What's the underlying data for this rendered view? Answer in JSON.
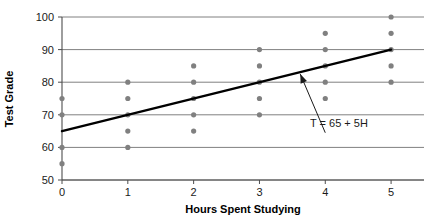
{
  "chart_data": {
    "type": "scatter",
    "title": "",
    "xlabel": "Hours Spent Studying",
    "ylabel": "Test Grade",
    "xlim": [
      0,
      5.5
    ],
    "ylim": [
      50,
      100
    ],
    "xticks": [
      "0",
      "1",
      "2",
      "3",
      "4",
      "5"
    ],
    "xtick_values": [
      0,
      1,
      2,
      3,
      4,
      5
    ],
    "yticks": [
      "50",
      "60",
      "70",
      "80",
      "90",
      "100"
    ],
    "ytick_values": [
      50,
      60,
      70,
      80,
      90,
      100
    ],
    "grid": "horizontal",
    "legend": "none",
    "points": [
      {
        "x": 0,
        "y": 75
      },
      {
        "x": 0,
        "y": 70
      },
      {
        "x": 0,
        "y": 60
      },
      {
        "x": 0,
        "y": 55
      },
      {
        "x": 1,
        "y": 80
      },
      {
        "x": 1,
        "y": 75
      },
      {
        "x": 1,
        "y": 70
      },
      {
        "x": 1,
        "y": 65
      },
      {
        "x": 1,
        "y": 60
      },
      {
        "x": 2,
        "y": 85
      },
      {
        "x": 2,
        "y": 80
      },
      {
        "x": 2,
        "y": 75
      },
      {
        "x": 2,
        "y": 70
      },
      {
        "x": 2,
        "y": 65
      },
      {
        "x": 3,
        "y": 90
      },
      {
        "x": 3,
        "y": 85
      },
      {
        "x": 3,
        "y": 80
      },
      {
        "x": 3,
        "y": 75
      },
      {
        "x": 3,
        "y": 70
      },
      {
        "x": 4,
        "y": 95
      },
      {
        "x": 4,
        "y": 90
      },
      {
        "x": 4,
        "y": 85
      },
      {
        "x": 4,
        "y": 80
      },
      {
        "x": 4,
        "y": 75
      },
      {
        "x": 5,
        "y": 100
      },
      {
        "x": 5,
        "y": 95
      },
      {
        "x": 5,
        "y": 90
      },
      {
        "x": 5,
        "y": 85
      },
      {
        "x": 5,
        "y": 80
      }
    ],
    "trendline": {
      "equation": "T = 65 + 5H",
      "intercept": 65,
      "slope": 5,
      "x_start": 0,
      "x_end": 5,
      "y_start": 65,
      "y_end": 90
    },
    "annotation": {
      "text": "T = 65 + 5H",
      "arrow_from_x": 4.0,
      "arrow_from_y": 64.5,
      "arrow_to_x": 3.62,
      "arrow_to_y": 82.5
    },
    "colors": {
      "point": "#808080",
      "gridline": "#808080",
      "axis": "#4d4d4d",
      "trendline": "#000000",
      "annotation": "#1a1a1a",
      "background": "#ffffff"
    }
  }
}
